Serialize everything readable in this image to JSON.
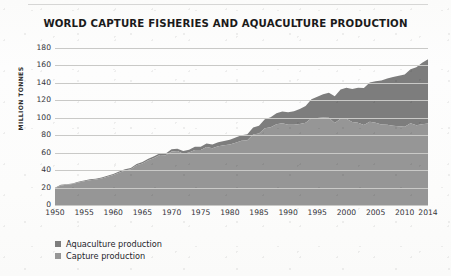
{
  "chart_data": {
    "type": "area",
    "stacked": true,
    "title": "WORLD CAPTURE FISHERIES AND AQUACULTURE PRODUCTION",
    "xlabel": "",
    "ylabel": "MILLION TONNES",
    "ylim": [
      0,
      180
    ],
    "xlim": [
      1950,
      2014
    ],
    "grid": true,
    "legend_position": "bottom-left",
    "ytick_labels": [
      "180",
      "160",
      "140",
      "120",
      "100",
      "80",
      "60",
      "40",
      "20",
      "0"
    ],
    "ytick_values": [
      180,
      160,
      140,
      120,
      100,
      80,
      60,
      40,
      20,
      0
    ],
    "xtick_labels": [
      "1950",
      "1955",
      "1960",
      "1965",
      "1970",
      "1975",
      "1980",
      "1985",
      "1990",
      "1995",
      "2000",
      "2005",
      "2010",
      "2014"
    ],
    "xtick_values": [
      1950,
      1955,
      1960,
      1965,
      1970,
      1975,
      1980,
      1985,
      1990,
      1995,
      2000,
      2005,
      2010,
      2014
    ],
    "colors": {
      "aquaculture": "#7d7d7d",
      "capture": "#969696"
    },
    "x": [
      1950,
      1951,
      1952,
      1953,
      1954,
      1955,
      1956,
      1957,
      1958,
      1959,
      1960,
      1961,
      1962,
      1963,
      1964,
      1965,
      1966,
      1967,
      1968,
      1969,
      1970,
      1971,
      1972,
      1973,
      1974,
      1975,
      1976,
      1977,
      1978,
      1979,
      1980,
      1981,
      1982,
      1983,
      1984,
      1985,
      1986,
      1987,
      1988,
      1989,
      1990,
      1991,
      1992,
      1993,
      1994,
      1995,
      1996,
      1997,
      1998,
      1999,
      2000,
      2001,
      2002,
      2003,
      2004,
      2005,
      2006,
      2007,
      2008,
      2009,
      2010,
      2011,
      2012,
      2013,
      2014
    ],
    "series": [
      {
        "name": "Capture production",
        "color": "#969696",
        "values": [
          19.3,
          22.5,
          23.2,
          24.0,
          25.8,
          27.2,
          28.5,
          29.1,
          30.3,
          32.4,
          34.3,
          37.0,
          39.6,
          40.9,
          45.5,
          47.5,
          51.2,
          53.9,
          57.2,
          57.0,
          61.4,
          61.8,
          58.9,
          60.1,
          63.2,
          63.0,
          66.6,
          65.0,
          67.3,
          68.5,
          69.4,
          71.4,
          73.6,
          74.1,
          80.9,
          82.0,
          88.0,
          89.0,
          92.5,
          93.6,
          92.0,
          92.0,
          93.0,
          94.3,
          99.4,
          99.7,
          100.3,
          99.9,
          94.0,
          99.0,
          99.0,
          95.1,
          94.3,
          91.8,
          95.4,
          94.2,
          92.4,
          92.1,
          91.0,
          90.3,
          89.6,
          93.7,
          91.3,
          92.6,
          93.4
        ]
      },
      {
        "name": "Aquaculture production",
        "color": "#7d7d7d",
        "values": [
          0.6,
          0.6,
          0.7,
          0.7,
          0.8,
          0.9,
          0.9,
          1.0,
          1.1,
          1.1,
          1.2,
          1.3,
          1.4,
          1.5,
          1.6,
          1.7,
          1.8,
          1.9,
          2.0,
          2.1,
          2.6,
          2.7,
          3.0,
          3.2,
          3.5,
          3.7,
          4.0,
          4.3,
          4.6,
          5.0,
          5.3,
          6.0,
          6.4,
          7.0,
          8.0,
          9.0,
          10.2,
          11.5,
          12.7,
          13.5,
          14.4,
          15.5,
          17.0,
          19.3,
          21.8,
          24.4,
          26.6,
          28.7,
          30.6,
          33.4,
          35.5,
          37.8,
          40.0,
          42.3,
          45.0,
          47.7,
          50.3,
          52.9,
          55.7,
          58.0,
          60.0,
          62.0,
          66.5,
          70.5,
          73.8
        ]
      }
    ]
  },
  "legend": {
    "items": [
      {
        "label": "Aquaculture production",
        "color": "#7d7d7d"
      },
      {
        "label": "Capture production",
        "color": "#969696"
      }
    ]
  }
}
